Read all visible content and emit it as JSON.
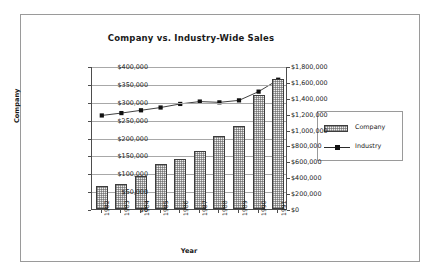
{
  "chart_data": {
    "type": "bar",
    "title": "Company vs. Industry-Wide Sales",
    "xlabel": "Year",
    "ylabel": "Company",
    "categories": [
      "1982",
      "1983",
      "1984",
      "1985",
      "1986",
      "1987",
      "1988",
      "1989",
      "1990",
      "1991"
    ],
    "series": [
      {
        "name": "Company",
        "type": "bar",
        "axis": "left",
        "values": [
          64000,
          70000,
          92000,
          125000,
          139000,
          162000,
          204000,
          231000,
          320000,
          363000
        ]
      },
      {
        "name": "Industry",
        "type": "line",
        "axis": "right",
        "values": [
          1190000,
          1220000,
          1255000,
          1290000,
          1335000,
          1365000,
          1355000,
          1380000,
          1490000,
          1640000
        ]
      }
    ],
    "ylim": [
      0,
      400000
    ],
    "y2lim": [
      0,
      1800000
    ],
    "yticks": [
      "$0",
      "$50,000",
      "$100,000",
      "$150,000",
      "$200,000",
      "$250,000",
      "$300,000",
      "$350,000",
      "$400,000"
    ],
    "y2ticks": [
      "$0",
      "$200,000",
      "$400,000",
      "$600,000",
      "$800,000",
      "$1,000,000",
      "$1,200,000",
      "$1,400,000",
      "$1,600,000",
      "$1,800,000"
    ],
    "grid": true,
    "legend_position": "right",
    "legend": [
      "Company",
      "Industry"
    ],
    "colors": {
      "bar_fill": "#efefef",
      "bar_edge": "#3d3d3d",
      "line": "#2b2b2b",
      "marker": "#111111",
      "grid": "#a8a8a8",
      "axis": "#4d4d4d",
      "text": "#1a1a1a",
      "frame": "#9a9a9a",
      "background": "#ffffff"
    }
  }
}
